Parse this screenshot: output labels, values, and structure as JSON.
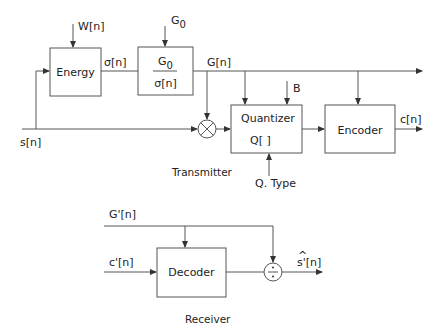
{
  "diagram": {
    "transmitter": {
      "caption": "Transmitter",
      "inputs": {
        "signal": "s[n]",
        "window": "W[n]",
        "gain_constant": "G0",
        "bits": "B",
        "quantizer_type": "Q. Type"
      },
      "blocks": {
        "energy": "Energy",
        "gain": {
          "numerator": "G",
          "numerator_sub": "0",
          "denominator": "σ[n]"
        },
        "quantizer": {
          "title": "Quantizer",
          "function": "Q[ ]"
        },
        "encoder": "Encoder"
      },
      "signals": {
        "sigma": "σ[n]",
        "gain": "G[n]",
        "output": "c[n]"
      },
      "g0_label": {
        "main": "G",
        "sub": "0"
      }
    },
    "receiver": {
      "caption": "Receiver",
      "inputs": {
        "gain": "G'[n]",
        "code": "c'[n]"
      },
      "blocks": {
        "decoder": "Decoder"
      },
      "output": {
        "hat": "^",
        "label": "s'[n]"
      }
    },
    "colors": {
      "line": "#555555",
      "text": "#222222",
      "background": "#ffffff"
    }
  }
}
